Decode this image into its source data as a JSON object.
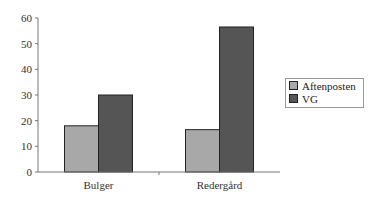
{
  "chart_data": {
    "type": "bar",
    "title": "",
    "xlabel": "",
    "ylabel": "",
    "categories": [
      "Bulger",
      "Redergård"
    ],
    "series": [
      {
        "name": "Aftenposten",
        "values": [
          18,
          16.5
        ],
        "color": "#a8a8a8"
      },
      {
        "name": "VG",
        "values": [
          30,
          56.5
        ],
        "color": "#555555"
      }
    ],
    "ylim": [
      0,
      60
    ],
    "yticks": [
      0,
      10,
      20,
      30,
      40,
      50,
      60
    ],
    "grid": false,
    "legend_position": "right"
  }
}
